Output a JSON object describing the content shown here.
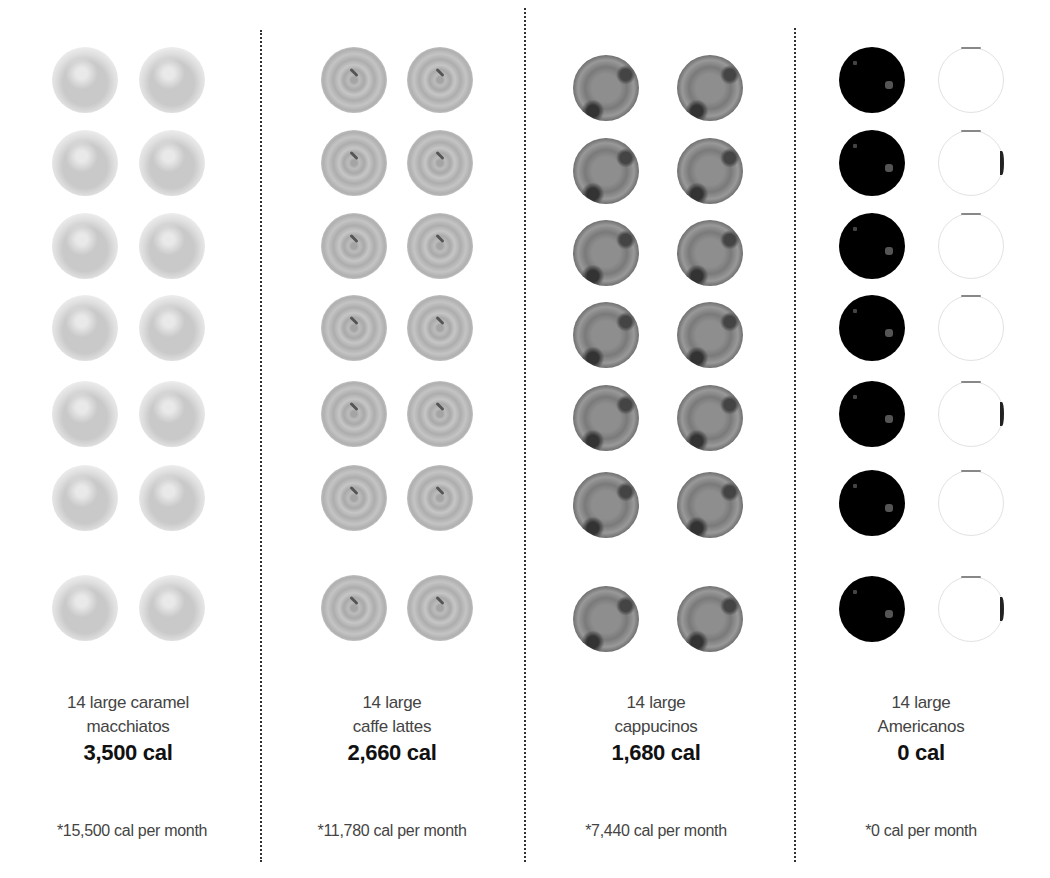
{
  "columns": [
    {
      "drink": "caramel macchiato",
      "cup_style": "macchiato",
      "line1": "14 large caramel",
      "line2": "macchiatos",
      "calories": "3,500 cal",
      "monthly": "*15,500 cal per month",
      "cups": 14
    },
    {
      "drink": "caffe latte",
      "cup_style": "latte",
      "line1": "14 large",
      "line2": "caffe lattes",
      "calories": "2,660 cal",
      "monthly": "*11,780 cal per month",
      "cups": 14
    },
    {
      "drink": "cappuccino",
      "cup_style": "cappuccino",
      "line1": "14 large",
      "line2": "cappucinos",
      "calories": "1,680 cal",
      "monthly": "*7,440 cal per month",
      "cups": 14
    },
    {
      "drink": "Americano",
      "cup_style": "americano",
      "line1": "14 large",
      "line2": "Americanos",
      "calories": "0 cal",
      "monthly": "*0 cal per month",
      "cups": 14
    }
  ],
  "icons": {
    "cup": "coffee-cup-top-view-icon",
    "empty_cup": "empty-cup-outline-icon"
  },
  "colors": {
    "divider": "#333333",
    "text": "#444444",
    "emphasis": "#111111"
  }
}
